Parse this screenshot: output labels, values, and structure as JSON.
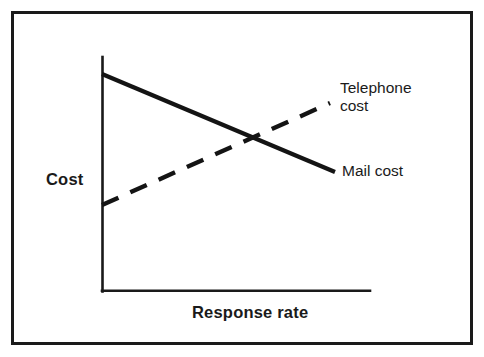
{
  "figure": {
    "background_color": "#ffffff",
    "frame_color": "#1a1a1a",
    "ink_color": "#141414"
  },
  "labels": {
    "y_axis_title": "Cost",
    "x_axis_title": "Response rate",
    "telephone_line1": "Telephone",
    "telephone_line2": "cost",
    "mail": "Mail cost"
  },
  "chart_data": {
    "type": "line",
    "title": "",
    "subtitle": "",
    "xlabel": "Response rate",
    "ylabel": "Cost",
    "xlim": [
      0,
      1
    ],
    "ylim": [
      0,
      1
    ],
    "grid": false,
    "xticks": [],
    "yticks": [],
    "xticklabels": [],
    "yticklabels": [],
    "axes_style": "open-L (left spine and bottom spine only, no ticks, no numeric scale)",
    "legend": "inline annotations at the right end of each line",
    "legend_position": "right",
    "series": [
      {
        "name": "Mail cost",
        "style": "solid",
        "linewidth_px": 4.2,
        "direction": "decreasing",
        "x": [
          0.0,
          1.0
        ],
        "y": [
          0.93,
          0.51
        ],
        "pixel_start": [
          102,
          74
        ],
        "pixel_end": [
          335,
          172
        ],
        "annotation": "Mail cost"
      },
      {
        "name": "Telephone cost",
        "style": "dashed",
        "linewidth_px": 4.4,
        "dash_pattern_px": [
          18,
          13
        ],
        "direction": "increasing",
        "x": [
          0.0,
          0.98
        ],
        "y": [
          0.37,
          0.81
        ],
        "pixel_start": [
          102,
          205
        ],
        "pixel_end": [
          330,
          103
        ],
        "annotation": "Telephone cost"
      }
    ],
    "annotations": [
      {
        "text": "Telephone cost",
        "attached_to": "Telephone cost",
        "position": "right of dashed line end"
      },
      {
        "text": "Mail cost",
        "attached_to": "Mail cost",
        "position": "right of solid line end"
      }
    ],
    "intersection_pixel": [
      258,
      137
    ],
    "interpretation": "Mail cost falls as response rate rises, while telephone cost rises; the two curves cross at a break-even response rate."
  }
}
